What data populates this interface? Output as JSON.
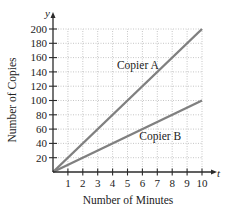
{
  "chart_data": {
    "type": "line",
    "title": "",
    "xlabel": "Number of Minutes",
    "ylabel": "Number of Copies",
    "x_axis_variable": "t",
    "y_axis_variable": "y",
    "xlim": [
      0,
      10
    ],
    "ylim": [
      0,
      200
    ],
    "x_ticks": [
      1,
      2,
      3,
      4,
      5,
      6,
      7,
      8,
      9,
      10
    ],
    "y_ticks": [
      20,
      40,
      60,
      80,
      100,
      120,
      140,
      160,
      180,
      200
    ],
    "grid": true,
    "legend": "inline labels",
    "series": [
      {
        "name": "Copier A",
        "x": [
          0,
          10
        ],
        "y": [
          0,
          200
        ],
        "color": "#808080",
        "label_position": {
          "x": 5.5,
          "y": 150
        }
      },
      {
        "name": "Copier B",
        "x": [
          0,
          10
        ],
        "y": [
          0,
          100
        ],
        "color": "#808080",
        "label_position": {
          "x": 7.0,
          "y": 50
        }
      }
    ]
  },
  "colors": {
    "axis": "#2b2b2b",
    "grid": "#b8b8b8",
    "line": "#808080"
  }
}
